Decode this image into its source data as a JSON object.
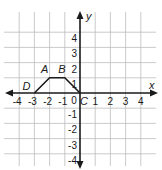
{
  "graph": {
    "x_axis_label": "x",
    "y_axis_label": "y",
    "origin_label": "0",
    "x_ticks": [
      "-4",
      "-3",
      "-2",
      "-1",
      "1",
      "2",
      "3",
      "4"
    ],
    "y_ticks": [
      "4",
      "3",
      "2",
      "1",
      "-1",
      "-2",
      "-3",
      "-4"
    ],
    "range": {
      "xmin": -4,
      "xmax": 4,
      "ymin": -4,
      "ymax": 4
    },
    "grid_color": "#bdbdbd",
    "axis_color": "#1a1a1a",
    "shape_color": "#1a1a1a",
    "points": [
      {
        "label": "D",
        "x": -3,
        "y": 0
      },
      {
        "label": "A",
        "x": -2,
        "y": 1
      },
      {
        "label": "B",
        "x": -1,
        "y": 1
      },
      {
        "label": "C",
        "x": 0,
        "y": 0
      }
    ]
  },
  "chart_data": {
    "type": "line",
    "title": "",
    "xlabel": "x",
    "ylabel": "y",
    "xlim": [
      -4,
      4
    ],
    "ylim": [
      -4,
      4
    ],
    "grid": true,
    "series": [
      {
        "name": "DABC",
        "x": [
          -3,
          -2,
          -1,
          0
        ],
        "y": [
          0,
          1,
          1,
          0
        ],
        "labels": [
          "D",
          "A",
          "B",
          "C"
        ]
      }
    ]
  }
}
